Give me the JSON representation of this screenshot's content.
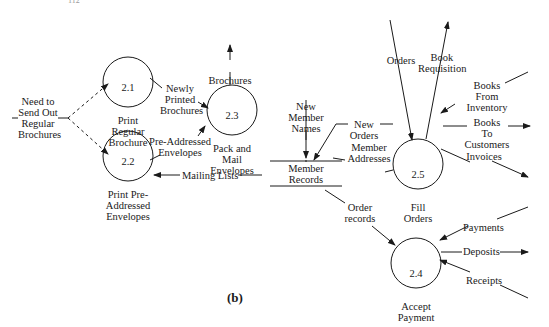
{
  "corner_text": "112",
  "figure_label": "(b)",
  "processes": [
    {
      "id": "2.1",
      "name": "Print\nRegular\nBrochure"
    },
    {
      "id": "2.2",
      "name": "Print Pre-\nAddressed\nEnvelopes"
    },
    {
      "id": "2.3",
      "name": "Pack and\nMail\nEnvelopes"
    },
    {
      "id": "2.4",
      "name": "Accept\nPayment"
    },
    {
      "id": "2.5",
      "name": "Fill\nOrders"
    }
  ],
  "data_store": {
    "name": "Member\nRecords"
  },
  "flows": {
    "need_to_send": "Need to\nSend Out\nRegular\nBrochures",
    "newly_printed": "Newly\nPrinted\nBrochures",
    "pre_addressed": "Pre-Addressed\nEnvelopes",
    "brochures": "Brochures",
    "mailing_lists": "Mailing Lists",
    "new_member_names": "New\nMember\nNames",
    "new_orders": "New\nOrders",
    "member_addresses": "Member\nAddresses",
    "order_records": "Order\nrecords",
    "orders": "Orders",
    "book_requisition": "Book\nRequisition",
    "books_from_inventory": "Books\nFrom\nInventory",
    "books_to_customers": "Books\nTo\nCustomers",
    "invoices": "Invoices",
    "payments": "Payments",
    "deposits": "Deposits",
    "receipts": "Receipts"
  }
}
